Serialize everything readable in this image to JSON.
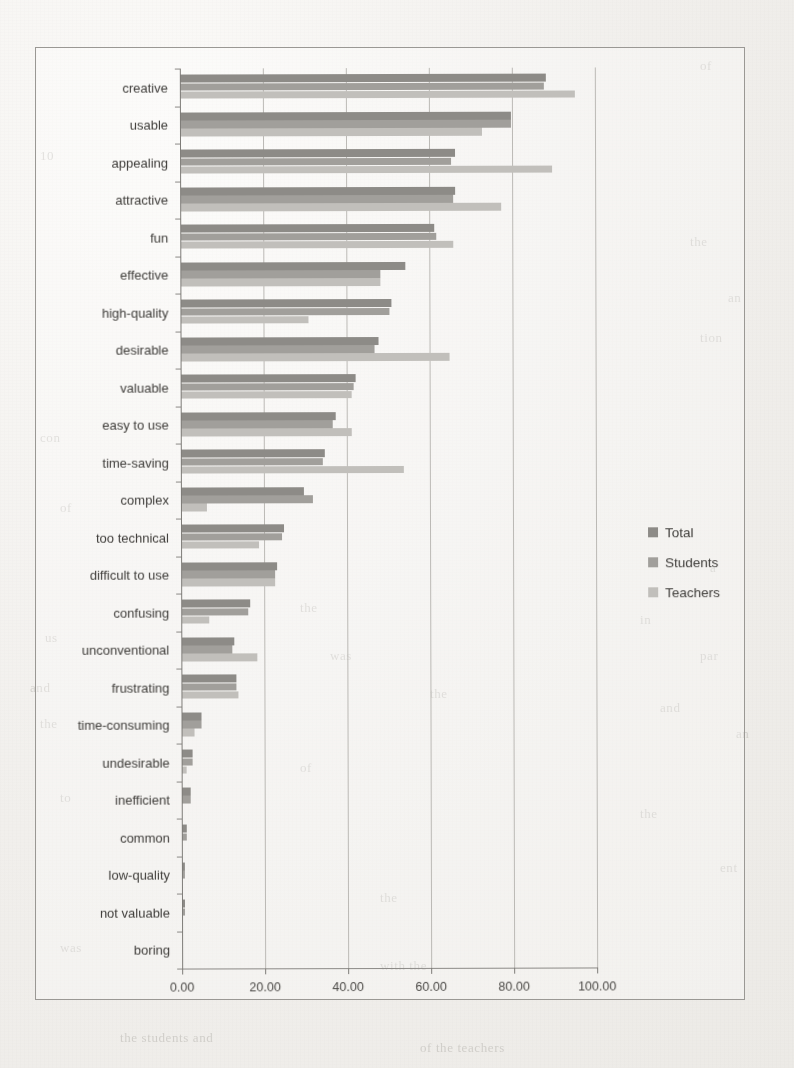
{
  "chart_data": {
    "type": "bar",
    "orientation": "horizontal",
    "title": "",
    "xlabel": "",
    "ylabel": "",
    "xlim": [
      0,
      100
    ],
    "xticks": [
      "0.00",
      "20.00",
      "40.00",
      "60.00",
      "80.00",
      "100.00"
    ],
    "xtick_values": [
      0,
      20,
      40,
      60,
      80,
      100
    ],
    "grid": true,
    "legend_position": "right",
    "categories": [
      "creative",
      "usable",
      "appealing",
      "attractive",
      "fun",
      "effective",
      "high-quality",
      "desirable",
      "valuable",
      "easy to use",
      "time-saving",
      "complex",
      "too technical",
      "difficult to use",
      "confusing",
      "unconventional",
      "frustrating",
      "time-consuming",
      "undesirable",
      "inefficient",
      "common",
      "low-quality",
      "not valuable",
      "boring"
    ],
    "series": [
      {
        "name": "Total",
        "color": "#8d8b87",
        "values": [
          88.0,
          79.5,
          66.0,
          66.0,
          61.0,
          54.0,
          50.5,
          47.5,
          42.0,
          37.0,
          34.5,
          29.5,
          24.5,
          23.0,
          16.5,
          12.5,
          13.0,
          4.5,
          2.5,
          2.0,
          1.0,
          0.5,
          0.5,
          0.0
        ]
      },
      {
        "name": "Students",
        "color": "#a2a09c",
        "values": [
          87.5,
          79.5,
          65.0,
          65.5,
          61.5,
          48.0,
          50.0,
          46.5,
          41.5,
          36.5,
          34.0,
          31.5,
          24.0,
          22.5,
          16.0,
          12.0,
          13.0,
          4.5,
          2.5,
          2.0,
          1.0,
          0.5,
          0.5,
          0.0
        ]
      },
      {
        "name": "Teachers",
        "color": "#c3c1bd",
        "values": [
          95.0,
          72.5,
          89.5,
          77.0,
          65.5,
          48.0,
          30.5,
          64.5,
          41.0,
          41.0,
          53.5,
          6.0,
          18.5,
          22.5,
          6.5,
          18.0,
          13.5,
          3.0,
          1.0,
          0.0,
          0.0,
          0.0,
          0.0,
          0.0
        ]
      }
    ]
  },
  "legend": {
    "items": [
      {
        "label": "Total"
      },
      {
        "label": "Students"
      },
      {
        "label": "Teachers"
      }
    ]
  },
  "page_background_text": [
    {
      "text": "of",
      "x": 700,
      "y": 58
    },
    {
      "text": "10",
      "x": 40,
      "y": 148
    },
    {
      "text": "the",
      "x": 690,
      "y": 234
    },
    {
      "text": "an",
      "x": 728,
      "y": 290
    },
    {
      "text": "tion",
      "x": 700,
      "y": 330
    },
    {
      "text": "con",
      "x": 40,
      "y": 430
    },
    {
      "text": "of",
      "x": 60,
      "y": 500
    },
    {
      "text": "a",
      "x": 710,
      "y": 560
    },
    {
      "text": "the",
      "x": 300,
      "y": 600
    },
    {
      "text": "in",
      "x": 640,
      "y": 612
    },
    {
      "text": "us",
      "x": 45,
      "y": 630
    },
    {
      "text": "was",
      "x": 330,
      "y": 648
    },
    {
      "text": "par",
      "x": 700,
      "y": 648
    },
    {
      "text": "and",
      "x": 30,
      "y": 680
    },
    {
      "text": "the",
      "x": 430,
      "y": 686
    },
    {
      "text": "and",
      "x": 660,
      "y": 700
    },
    {
      "text": "the",
      "x": 40,
      "y": 716
    },
    {
      "text": "an",
      "x": 736,
      "y": 726
    },
    {
      "text": "of",
      "x": 300,
      "y": 760
    },
    {
      "text": "to",
      "x": 60,
      "y": 790
    },
    {
      "text": "the",
      "x": 640,
      "y": 806
    },
    {
      "text": "ent",
      "x": 720,
      "y": 860
    },
    {
      "text": "the",
      "x": 380,
      "y": 890
    },
    {
      "text": "was",
      "x": 60,
      "y": 940
    },
    {
      "text": "with the",
      "x": 380,
      "y": 958
    },
    {
      "text": "the students and",
      "x": 120,
      "y": 1030
    },
    {
      "text": "of the teachers",
      "x": 420,
      "y": 1040
    }
  ]
}
